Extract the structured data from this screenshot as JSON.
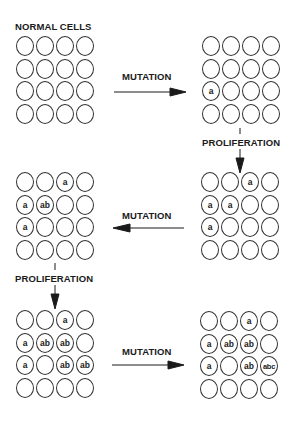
{
  "diagram": {
    "title": "NORMAL CELLS",
    "labels": {
      "mutation_1": "MUTATION",
      "proliferation_1": "PROLIFERATION",
      "mutation_2": "MUTATION",
      "proliferation_2": "PROLIFERATION",
      "mutation_3": "MUTATION"
    },
    "colors": {
      "stroke": "#333333",
      "text": "#1a1a1a",
      "background": "#ffffff"
    },
    "grids": [
      {
        "id": "normal-cells",
        "cells": [
          [
            "",
            "",
            "",
            ""
          ],
          [
            "",
            "",
            "",
            ""
          ],
          [
            "",
            "",
            "",
            ""
          ],
          [
            "",
            "",
            "",
            ""
          ]
        ]
      },
      {
        "id": "after-mutation-1",
        "cells": [
          [
            "",
            "",
            "",
            ""
          ],
          [
            "",
            "",
            "",
            ""
          ],
          [
            "a",
            "",
            "",
            ""
          ],
          [
            "",
            "",
            "",
            ""
          ]
        ]
      },
      {
        "id": "after-proliferation-1",
        "cells": [
          [
            "",
            "",
            "a",
            ""
          ],
          [
            "a",
            "a",
            "",
            ""
          ],
          [
            "a",
            "",
            "",
            ""
          ],
          [
            "",
            "",
            "",
            ""
          ]
        ]
      },
      {
        "id": "after-mutation-2",
        "cells": [
          [
            "",
            "",
            "a",
            ""
          ],
          [
            "a",
            "ab",
            "",
            ""
          ],
          [
            "a",
            "",
            "",
            ""
          ],
          [
            "",
            "",
            "",
            ""
          ]
        ]
      },
      {
        "id": "after-proliferation-2",
        "cells": [
          [
            "",
            "",
            "a",
            ""
          ],
          [
            "a",
            "ab",
            "ab",
            ""
          ],
          [
            "a",
            "",
            "ab",
            "ab"
          ],
          [
            "",
            "",
            "",
            ""
          ]
        ]
      },
      {
        "id": "after-mutation-3",
        "cells": [
          [
            "",
            "",
            "a",
            ""
          ],
          [
            "a",
            "ab",
            "ab",
            ""
          ],
          [
            "a",
            "",
            "ab",
            "abc"
          ],
          [
            "",
            "",
            "",
            ""
          ]
        ]
      }
    ],
    "flow": [
      {
        "from": "normal-cells",
        "to": "after-mutation-1",
        "label": "MUTATION",
        "direction": "right"
      },
      {
        "from": "after-mutation-1",
        "to": "after-proliferation-1",
        "label": "PROLIFERATION",
        "direction": "down"
      },
      {
        "from": "after-proliferation-1",
        "to": "after-mutation-2",
        "label": "MUTATION",
        "direction": "left"
      },
      {
        "from": "after-mutation-2",
        "to": "after-proliferation-2",
        "label": "PROLIFERATION",
        "direction": "down"
      },
      {
        "from": "after-proliferation-2",
        "to": "after-mutation-3",
        "label": "MUTATION",
        "direction": "right"
      }
    ]
  }
}
